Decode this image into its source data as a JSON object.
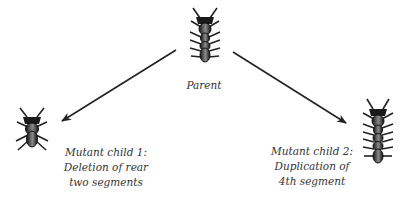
{
  "diagram": {
    "type": "mutation-illustration",
    "colors": {
      "ink": "#222222",
      "text": "#333333",
      "background": "#ffffff"
    },
    "nodes": [
      {
        "id": "parent",
        "label_lines": [
          "Parent"
        ],
        "icon": "segmented-insect-icon",
        "segments": 4
      },
      {
        "id": "child1",
        "label_lines": [
          "Mutant child 1:",
          "Deletion of rear",
          "two segments"
        ],
        "icon": "segmented-insect-icon",
        "segments": 2
      },
      {
        "id": "child2",
        "label_lines": [
          "Mutant child 2:",
          "Duplication of",
          "4th segment"
        ],
        "icon": "segmented-insect-icon",
        "segments": 5
      }
    ],
    "edges": [
      {
        "from": "parent",
        "to": "child1",
        "style": "arrow"
      },
      {
        "from": "parent",
        "to": "child2",
        "style": "arrow"
      }
    ]
  }
}
